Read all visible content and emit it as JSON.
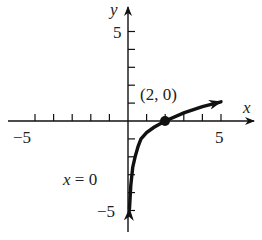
{
  "chart_data": {
    "type": "line",
    "title": "",
    "xlabel": "x",
    "ylabel": "y",
    "xlim": [
      -5.5,
      6.5
    ],
    "ylim": [
      -6,
      6
    ],
    "x_ticks": [
      -5,
      -4,
      -3,
      -2,
      -1,
      1,
      2,
      3,
      4,
      5
    ],
    "y_ticks": [
      -5,
      -4,
      -3,
      -2,
      -1,
      1,
      2,
      3,
      4,
      5
    ],
    "x_tick_labels": {
      "-5": "−5",
      "5": "5"
    },
    "y_tick_labels": {
      "5": "5",
      "-5": "−5"
    },
    "grid": false,
    "series": [
      {
        "name": "logarithmic curve",
        "x": [
          0.08,
          0.15,
          0.25,
          0.38,
          0.55,
          0.7,
          1.0,
          1.4,
          2.0,
          3.0,
          4.0,
          5.0
        ],
        "y": [
          -4.9,
          -3.6,
          -2.6,
          -2.0,
          -1.4,
          -1.0,
          -0.65,
          -0.35,
          0.0,
          0.45,
          0.8,
          1.07
        ],
        "arrows": "both ends"
      }
    ],
    "annotations": [
      {
        "text": "(2, 0)",
        "x": 2,
        "y": 0,
        "marker": "filled-dot"
      },
      {
        "text": "x = 0",
        "description": "vertical asymptote label"
      }
    ]
  },
  "labels": {
    "y_axis": "y",
    "x_axis": "x",
    "y_top": "5",
    "y_bottom": "−5",
    "x_left": "−5",
    "x_right": "5",
    "point": "(2, 0)",
    "asymptote_x": "x",
    "asymptote_rest": " = 0"
  }
}
